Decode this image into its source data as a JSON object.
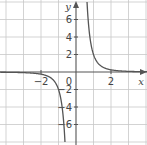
{
  "chart_data": {
    "type": "line",
    "title": "",
    "xlabel": "x",
    "ylabel": "y",
    "xlim": [
      -4.3,
      4
    ],
    "ylim": [
      -8,
      8.2
    ],
    "grid": true,
    "x_ticks": [
      -2,
      2
    ],
    "y_ticks": [
      -6,
      -4,
      -2,
      2,
      4,
      6
    ],
    "origin_label": "0",
    "x_grid_step": 1,
    "y_grid_step": 2,
    "series": [
      {
        "name": "curve",
        "function": "y = 2/x^3",
        "branches": [
          {
            "x": [
              0.63,
              0.7,
              0.8,
              1.0,
              1.2,
              1.5,
              2.0,
              2.5,
              3.0
            ],
            "y": [
              8.0,
              5.83,
              3.91,
              2.0,
              1.16,
              0.59,
              0.25,
              0.13,
              0.07
            ]
          },
          {
            "x": [
              -4.3,
              -3.0,
              -2.0,
              -1.5,
              -1.2,
              -1.0,
              -0.8,
              -0.7,
              -0.63
            ],
            "y": [
              -0.03,
              -0.07,
              -0.25,
              -0.59,
              -1.16,
              -2.0,
              -3.91,
              -5.83,
              -8.0
            ]
          }
        ]
      }
    ],
    "colors": {
      "grid": "#c8c8c8",
      "axis": "#555555",
      "curve": "#555555"
    }
  }
}
